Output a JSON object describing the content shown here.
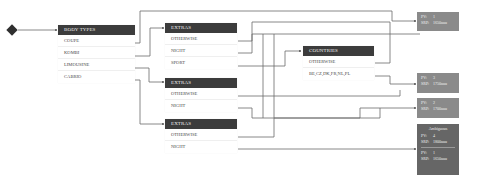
{
  "start": {
    "icon": "diamond-start-icon"
  },
  "tables": {
    "body_types": {
      "header": "BODY TYPES",
      "rows": [
        "COUPE",
        "KOMBI",
        "LIMOUSINE",
        "CABRIO"
      ]
    },
    "extras_1": {
      "header": "EXTRAS",
      "rows": [
        "OTHERWISE",
        "NIGHT",
        "SPORT"
      ]
    },
    "extras_2": {
      "header": "EXTRAS",
      "rows": [
        "OTHERWISE",
        "NIGHT"
      ]
    },
    "extras_3": {
      "header": "EXTRAS",
      "rows": [
        "OTHERWISE",
        "NIGHT"
      ]
    },
    "countries": {
      "header": "COUNTRIES",
      "rows": [
        "OTHERWISE",
        "BE,CZ,DK,FR,NL,PL"
      ]
    }
  },
  "results": [
    {
      "pv_label": "PV:",
      "pv": "1",
      "srp_label": "SRP:",
      "srp": "1650uuu"
    },
    {
      "pv_label": "PV:",
      "pv": "3",
      "srp_label": "SRP:",
      "srp": "1750uuu"
    },
    {
      "pv_label": "PV:",
      "pv": "2",
      "srp_label": "SRP:",
      "srp": "1700uuu"
    },
    {
      "title": "Ambiguous",
      "entries": [
        {
          "pv_label": "PV:",
          "pv": "4",
          "srp_label": "SRP:",
          "srp": "1800uuu"
        },
        {
          "pv_label": "PV:",
          "pv": "1",
          "srp_label": "SRP:",
          "srp": "1650uuu"
        }
      ]
    }
  ],
  "colors": {
    "header_bg": "#3c3c3c",
    "result_bg": "#8a8a8a",
    "result_ambiguous_bg": "#666666",
    "wire": "#6a6a6a"
  }
}
